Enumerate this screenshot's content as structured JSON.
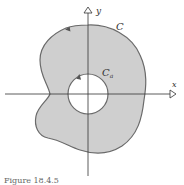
{
  "figure": {
    "caption": "Figure 18.4.5",
    "labels": {
      "y_axis": "y",
      "x_axis": "x",
      "outer_curve": "C",
      "inner_curve_main": "C",
      "inner_curve_sub": "a"
    },
    "colors": {
      "region_fill": "#cfcfcf",
      "curve_stroke": "#6a6a6a",
      "axis_stroke": "#333333",
      "hole_fill": "#ffffff"
    }
  }
}
